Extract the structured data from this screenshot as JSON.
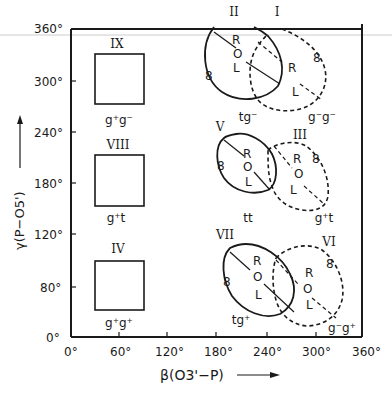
{
  "figure": {
    "x_axis": {
      "label": "β(O3'−P)",
      "ticks": [
        "0°",
        "60°",
        "120°",
        "180°",
        "240°",
        "300°",
        "360°"
      ]
    },
    "y_axis": {
      "label": "γ(P−O5')",
      "ticks": [
        "0°",
        "80°",
        "120°",
        "180°",
        "240°",
        "300°",
        "360°"
      ]
    },
    "boxes": [
      {
        "id": "IX",
        "label": "IX",
        "conformation": "g⁺g⁻"
      },
      {
        "id": "VIII",
        "label": "VIII",
        "conformation": "g⁺t"
      },
      {
        "id": "IV",
        "label": "IV",
        "conformation": "g⁺g⁺"
      }
    ],
    "ellipses": [
      {
        "id": "II",
        "label": "II",
        "style": "solid",
        "conformation": "tg⁻",
        "marks": [
          "R",
          "O",
          "L",
          "8"
        ]
      },
      {
        "id": "I",
        "label": "I",
        "style": "dashed",
        "conformation": "g⁻g⁻",
        "marks": [
          "R",
          "L",
          "8"
        ]
      },
      {
        "id": "V",
        "label": "V",
        "style": "solid",
        "conformation": "tt",
        "marks": [
          "R",
          "O",
          "L",
          "8"
        ]
      },
      {
        "id": "III",
        "label": "III",
        "style": "dashed",
        "conformation": "g⁺t",
        "marks": [
          "R",
          "O",
          "L",
          "8"
        ]
      },
      {
        "id": "VII",
        "label": "VII",
        "style": "solid",
        "conformation": "tg⁺",
        "marks": [
          "R",
          "O",
          "L",
          "8"
        ]
      },
      {
        "id": "VI",
        "label": "VI",
        "style": "dashed",
        "conformation": "g⁻g⁺",
        "marks": [
          "R",
          "O",
          "L",
          "8"
        ]
      }
    ],
    "marks": {
      "R": "R",
      "O": "O",
      "L": "L",
      "eight": "8"
    }
  }
}
